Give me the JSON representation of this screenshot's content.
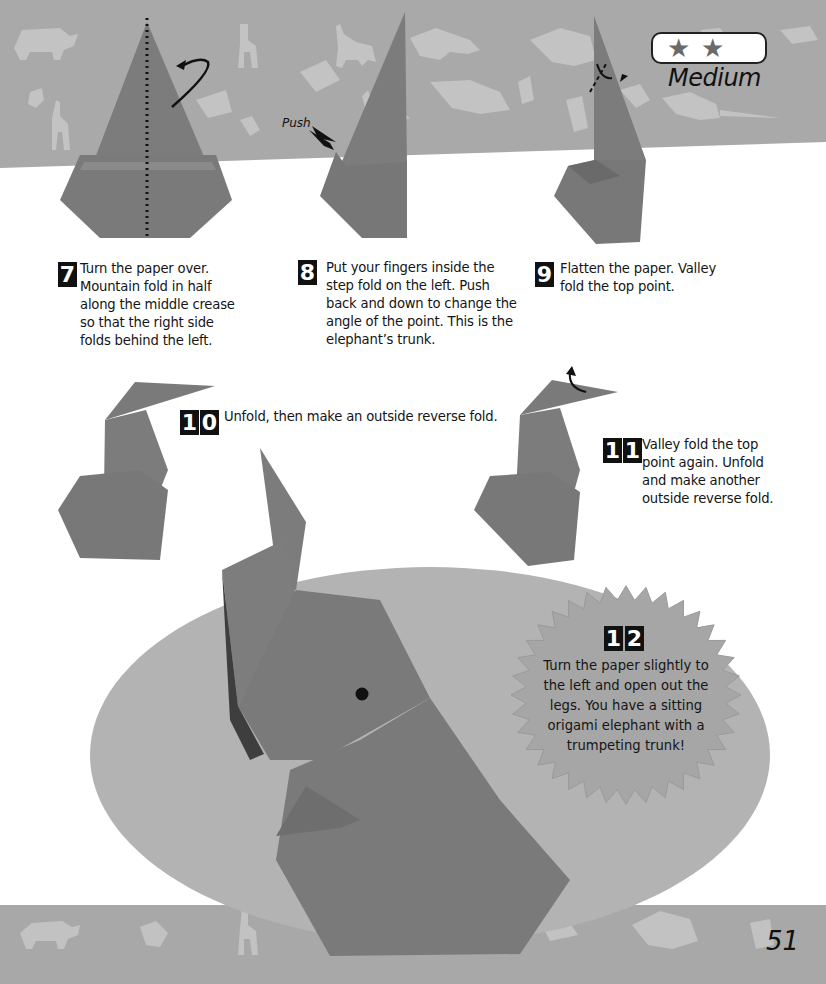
{
  "difficulty": {
    "stars_filled": 2,
    "star_glyph": "★",
    "label": "Medium"
  },
  "annotations": {
    "push_label": "Push"
  },
  "steps": [
    {
      "number": "7",
      "digits": [
        "7"
      ],
      "text_lines": [
        "Turn the paper over.",
        "Mountain fold in half",
        "along the middle crease",
        "so that the right side",
        "folds behind the left."
      ]
    },
    {
      "number": "8",
      "digits": [
        "8"
      ],
      "text_lines": [
        "Put your fingers inside the",
        "step fold on the left. Push",
        "back and down to change the",
        "angle of the point. This is the",
        "elephant’s trunk."
      ]
    },
    {
      "number": "9",
      "digits": [
        "9"
      ],
      "text_lines": [
        "Flatten the paper. Valley",
        "fold the top point."
      ]
    },
    {
      "number": "10",
      "digits": [
        "1",
        "0"
      ],
      "text_lines": [
        "Unfold, then make an outside reverse fold."
      ]
    },
    {
      "number": "11",
      "digits": [
        "1",
        "1"
      ],
      "text_lines": [
        "Valley fold the top",
        "point again. Unfold",
        "and make another",
        "outside reverse fold."
      ]
    },
    {
      "number": "12",
      "digits": [
        "1",
        "2"
      ],
      "text_lines": [
        "Turn the paper slightly to",
        "the left and open out the",
        "legs. You have a sitting",
        "origami elephant with a",
        "trumpeting trunk!"
      ]
    }
  ],
  "page_number": "51",
  "colors": {
    "band": "#a9a9a9",
    "paper": "#7b7b7b",
    "paper_dark": "#5e5e5e",
    "ellipse": "#b3b3b3",
    "burst": "#a6a6a6",
    "silhouette": "#c6c6c6",
    "text": "#151515"
  }
}
